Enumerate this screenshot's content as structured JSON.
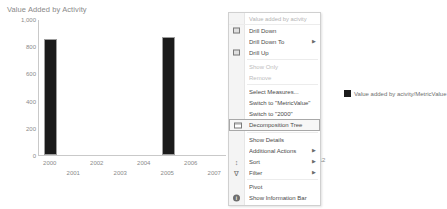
{
  "chart_data": {
    "type": "bar",
    "title": "Value Added by Activity",
    "xlabel": "",
    "ylabel": "",
    "ylim": [
      0,
      1000
    ],
    "yticks": [
      "0",
      "200",
      "400",
      "600",
      "800",
      "1,000"
    ],
    "ytick_values": [
      0,
      200,
      400,
      600,
      800,
      1000
    ],
    "categories": [
      "2000",
      "2001",
      "2002",
      "2003",
      "2004",
      "2005",
      "2006",
      "2007"
    ],
    "values": [
      855,
      0,
      0,
      0,
      0,
      870,
      0,
      0
    ],
    "series": [
      {
        "name": "Value added by acivity/MetricValue",
        "color": "#1b1b1b",
        "values": [
          855,
          0,
          0,
          0,
          0,
          870,
          0,
          0
        ]
      }
    ],
    "legend": {
      "position": "right",
      "entries": [
        {
          "label": "Value added by acivity/MetricValue",
          "color": "#1b1b1b"
        }
      ]
    },
    "grid": false
  },
  "chart": {
    "title": "Value Added by Activity",
    "orphan_axis_label": "2012"
  },
  "legend": {
    "label": "Value added by acivity/MetricValue",
    "color": "#1b1b1b"
  },
  "context_menu": {
    "header": "Value added by acivity",
    "items": [
      {
        "label": "Drill Down",
        "icon": "drill-down-icon",
        "icon_glyph": "box",
        "disabled": false,
        "submenu": false,
        "selected": false
      },
      {
        "label": "Drill Down To",
        "icon": "drill-down-to-icon",
        "icon_glyph": "",
        "disabled": false,
        "submenu": true,
        "selected": false
      },
      {
        "label": "Drill Up",
        "icon": "drill-up-icon",
        "icon_glyph": "box",
        "disabled": false,
        "submenu": false,
        "selected": false
      },
      {
        "label": "Show Only",
        "icon": "",
        "icon_glyph": "",
        "disabled": true,
        "submenu": false,
        "selected": false
      },
      {
        "label": "Remove",
        "icon": "",
        "icon_glyph": "",
        "disabled": true,
        "submenu": false,
        "selected": false
      },
      {
        "label": "Select Measures...",
        "icon": "",
        "icon_glyph": "",
        "disabled": false,
        "submenu": false,
        "selected": false
      },
      {
        "label": "Switch to \"MetricValue\"",
        "icon": "",
        "icon_glyph": "",
        "disabled": false,
        "submenu": false,
        "selected": false
      },
      {
        "label": "Switch to \"2000\"",
        "icon": "",
        "icon_glyph": "",
        "disabled": false,
        "submenu": false,
        "selected": false
      },
      {
        "label": "Decomposition Tree",
        "icon": "decomposition-tree-icon",
        "icon_glyph": "tree",
        "disabled": false,
        "submenu": false,
        "selected": true
      },
      {
        "label": "Show Details",
        "icon": "",
        "icon_glyph": "",
        "disabled": false,
        "submenu": false,
        "selected": false
      },
      {
        "label": "Additional Actions",
        "icon": "",
        "icon_glyph": "",
        "disabled": false,
        "submenu": true,
        "selected": false
      },
      {
        "label": "Sort",
        "icon": "sort-icon",
        "icon_glyph": "sort",
        "disabled": false,
        "submenu": true,
        "selected": false
      },
      {
        "label": "Filter",
        "icon": "filter-icon",
        "icon_glyph": "funnel",
        "disabled": false,
        "submenu": true,
        "selected": false
      },
      {
        "label": "Pivot",
        "icon": "",
        "icon_glyph": "",
        "disabled": false,
        "submenu": false,
        "selected": false
      },
      {
        "label": "Show Information Bar",
        "icon": "information-bar-icon",
        "icon_glyph": "info",
        "disabled": false,
        "submenu": false,
        "selected": false
      }
    ]
  }
}
